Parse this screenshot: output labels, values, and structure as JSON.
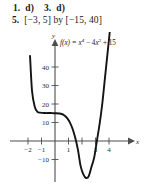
{
  "answers": {
    "line1": {
      "item1_number": "1.",
      "item1_answer": "d)",
      "item3_number": "3.",
      "item3_answer": "d)"
    },
    "line2": {
      "item5_number": "5.",
      "item5_answer": "[−3, 5] by [−15, 40]"
    }
  },
  "chart_data": {
    "type": "line",
    "title": "",
    "equation_label": "f(x) = x⁴ − 4x³ + 15",
    "equation_parts": {
      "fx": "f(x) = ",
      "term1_base": "x",
      "term1_exp": "4",
      "minus": " − ",
      "term2_coef": "4",
      "term2_base": "x",
      "term2_exp": "3",
      "plus": " + ",
      "constant": "15"
    },
    "xlabel": "x",
    "ylabel": "y",
    "xlim": [
      -3,
      5
    ],
    "ylim": [
      -15,
      40
    ],
    "grid": false,
    "legend": "none",
    "xticks": [
      {
        "value": -2,
        "label": "−2"
      },
      {
        "value": -1,
        "label": "−1"
      },
      {
        "value": 1,
        "label": "1"
      },
      {
        "value": 2,
        "label": ""
      },
      {
        "value": 3,
        "label": "3"
      },
      {
        "value": 4,
        "label": "4"
      }
    ],
    "yticks": [
      {
        "value": 40,
        "label": "40"
      },
      {
        "value": 30,
        "label": "30"
      },
      {
        "value": 20,
        "label": "20"
      },
      {
        "value": 10,
        "label": "10"
      },
      {
        "value": -10,
        "label": "−10"
      }
    ],
    "series": [
      {
        "name": "f(x) = x^4 - 4x^3 + 15",
        "x": [
          -1.85,
          -1.7,
          -1.5,
          -1.3,
          -1.1,
          -0.9,
          -0.7,
          -0.5,
          -0.3,
          -0.1,
          0.1,
          0.3,
          0.5,
          0.7,
          0.9,
          1.1,
          1.3,
          1.5,
          1.7,
          1.9,
          2.1,
          2.3,
          2.5,
          2.7,
          2.9,
          3.1,
          3.3,
          3.5,
          3.7,
          3.9,
          4.1,
          4.25
        ],
        "y": [
          46.0,
          27.0,
          18.5,
          15.8,
          15.3,
          15.2,
          15.1,
          15.1,
          15.1,
          15.0,
          15.0,
          14.9,
          14.6,
          13.8,
          12.4,
          10.1,
          6.6,
          1.7,
          -4.8,
          -13.6,
          -18.0,
          -20.0,
          -19.0,
          -14.0,
          -9.0,
          0.0,
          9.0,
          20.0,
          34.0,
          48.0,
          62.0,
          72.0
        ],
        "note": "quartic f(x)=x^4-4x^3+15, plateau near x=0 at y=15, local min near x=3 at y≈-12, roots near x≈2.3 and x≈3.6"
      }
    ]
  }
}
